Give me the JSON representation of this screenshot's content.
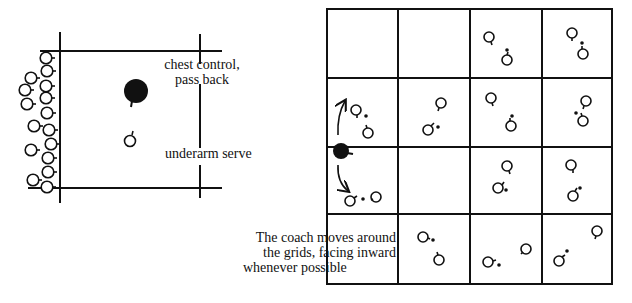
{
  "left_diagram": {
    "labels": {
      "chest_control": "chest control,",
      "pass_back": "pass back",
      "underarm_serve": "underarm serve"
    }
  },
  "right_diagram": {
    "grid": {
      "rows": 4,
      "cols": 4
    },
    "caption": {
      "line1": "The coach moves around",
      "line2": "the grids, facing inward",
      "line3": "whenever possible"
    }
  },
  "colors": {
    "ink": "#111111",
    "background": "#ffffff"
  }
}
